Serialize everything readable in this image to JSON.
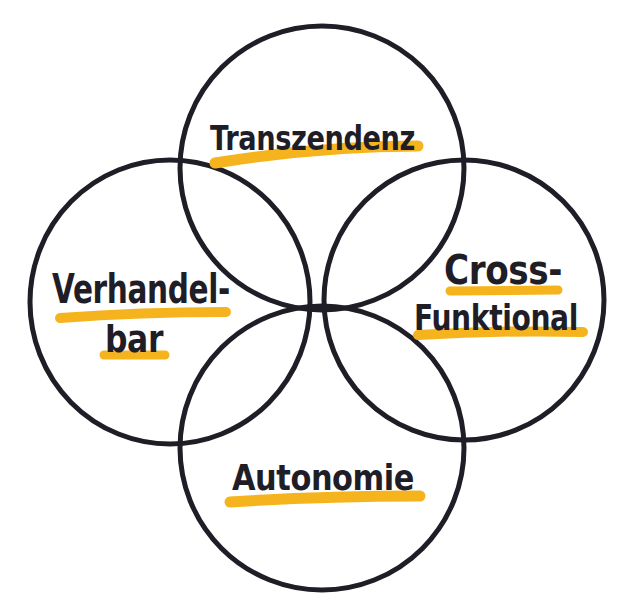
{
  "diagram": {
    "type": "four-circle-venn",
    "colors": {
      "stroke": "#1f1d26",
      "highlight": "#f5b41e",
      "background": "#ffffff"
    },
    "circles": [
      {
        "id": "top",
        "label_lines": [
          "Transzendenz"
        ]
      },
      {
        "id": "left",
        "label_lines": [
          "Verhandel-",
          "bar"
        ]
      },
      {
        "id": "right",
        "label_lines": [
          "Cross-",
          "Funktional"
        ]
      },
      {
        "id": "bottom",
        "label_lines": [
          "Autonomie"
        ]
      }
    ]
  }
}
